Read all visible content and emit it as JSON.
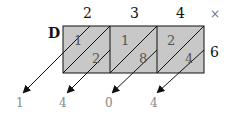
{
  "diagram": {
    "type": "lattice-multiplication",
    "multiplicand_digits": [
      "2",
      "3",
      "4"
    ],
    "multiplier_digit": "6",
    "operator": "×",
    "corner_label": "D",
    "cells": [
      {
        "tens": "1",
        "ones": "2"
      },
      {
        "tens": "1",
        "ones": "8"
      },
      {
        "tens": "2",
        "ones": "4"
      }
    ],
    "result_digits": [
      "1",
      "4",
      "0",
      "4"
    ],
    "colors": {
      "cell_fill": "#c8c8c8",
      "line": "#111111",
      "result_text": "#888888"
    }
  }
}
